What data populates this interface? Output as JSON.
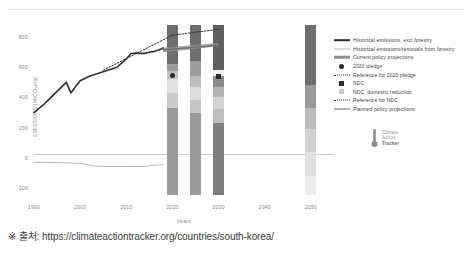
{
  "caption": "※ 출처: https://climateactiontracker.org/countries/south-korea/",
  "logo": {
    "line1": "Climate",
    "line2": "Action",
    "line3": "Tracker",
    "icon": "thermometer-icon"
  },
  "legend": {
    "items": [
      {
        "key": "thick-line",
        "color": "#2f2f2f",
        "label": "Historical emissions, excl forestry"
      },
      {
        "key": "thin-line",
        "color": "#b9b9b9",
        "label": "Historical emissions/removals from forestry"
      },
      {
        "key": "thick-band",
        "color": "#8f8f8f",
        "label": "Current policy projections"
      },
      {
        "key": "dot",
        "color": "#2b2b2b",
        "label": "2020 pledge"
      },
      {
        "key": "dotted-line",
        "color": "#2f2f2f",
        "label": "Reference for 2020 pledge"
      },
      {
        "key": "square",
        "color": "#2b2b2b",
        "label": "NDC"
      },
      {
        "key": "square-light",
        "color": "#c9c9c9",
        "label": "NDC, domestic reduction"
      },
      {
        "key": "dotted-line",
        "color": "#2f2f2f",
        "label": "Reference for NDC"
      },
      {
        "key": "line",
        "color": "#6d6d6d",
        "label": "Planned policy projections"
      }
    ]
  },
  "chart_data": {
    "type": "line",
    "title": "",
    "xlabel": "Years",
    "ylabel": "EMISSIONS [MtCO₂e/a]",
    "xlim": [
      1990,
      2055
    ],
    "ylim": [
      -280,
      900
    ],
    "xticks": [
      1990,
      2000,
      2010,
      2020,
      2030,
      2040,
      2050
    ],
    "xtick_labels": [
      "1990",
      "2000",
      "2010",
      "2020",
      "2030",
      "2040",
      "2050"
    ],
    "yticks": [
      800,
      600,
      400,
      200,
      0,
      -200
    ],
    "ytick_labels": [
      "800",
      "600",
      "400",
      "200",
      "0",
      "-200"
    ],
    "grid": false,
    "legend_position": "right",
    "series": [
      {
        "name": "Historical emissions, excl forestry",
        "type": "line",
        "color": "#2f2f2f",
        "width": 1.6,
        "x": [
          1990,
          1992,
          1994,
          1996,
          1997,
          1998,
          1999,
          2000,
          2002,
          2004,
          2006,
          2008,
          2010,
          2011,
          2012,
          2013,
          2014,
          2015,
          2016,
          2017,
          2018
        ],
        "y": [
          300,
          350,
          410,
          470,
          500,
          430,
          470,
          510,
          540,
          560,
          580,
          600,
          655,
          690,
          695,
          692,
          692,
          700,
          705,
          715,
          728
        ]
      },
      {
        "name": "Historical emissions/removals from forestry",
        "type": "line",
        "color": "#b9b9b9",
        "width": 1.0,
        "x": [
          1990,
          1995,
          2000,
          2003,
          2005,
          2010,
          2014,
          2016,
          2018
        ],
        "y": [
          -30,
          -32,
          -38,
          -55,
          -58,
          -58,
          -57,
          -50,
          -45
        ]
      },
      {
        "name": "Current policy projections",
        "type": "band",
        "color": "#8f8f8f",
        "opacity": 0.85,
        "x": [
          2018,
          2030
        ],
        "y_low": [
          700,
          740
        ],
        "y_high": [
          730,
          760
        ]
      },
      {
        "name": "Reference for 2020 pledge",
        "type": "dotted",
        "color": "#2f2f2f",
        "x": [
          2005,
          2020
        ],
        "y": [
          580,
          813
        ]
      },
      {
        "name": "Reference for NDC",
        "type": "dotted",
        "color": "#2f2f2f",
        "x": [
          2020,
          2030
        ],
        "y": [
          813,
          851
        ]
      },
      {
        "name": "Planned policy projections",
        "type": "line",
        "color": "#6d6d6d",
        "width": 1.2,
        "x": [
          2018,
          2030
        ],
        "y": [
          715,
          745
        ]
      }
    ],
    "markers": [
      {
        "name": "2020 pledge",
        "shape": "circle",
        "x": 2020,
        "y": 543,
        "color": "#2b2b2b"
      },
      {
        "name": "NDC",
        "shape": "square",
        "x": 2030,
        "y": 536,
        "color": "#2b2b2b"
      }
    ],
    "bars": [
      {
        "name": "2020-bar",
        "x": 2020,
        "top": 880,
        "bottom": -250,
        "segments": [
          {
            "from": 620,
            "to": 880,
            "color": "#6e6e6e"
          },
          {
            "from": 575,
            "to": 620,
            "color": "#9c9c9c"
          },
          {
            "from": 520,
            "to": 575,
            "color": "#c2c2c2"
          },
          {
            "from": 430,
            "to": 520,
            "color": "#e2e2e2"
          },
          {
            "from": 330,
            "to": 430,
            "color": "#cbcbcb"
          },
          {
            "from": -250,
            "to": 330,
            "color": "#9a9a9a"
          }
        ]
      },
      {
        "name": "2025-bar",
        "x": 2025,
        "top": 880,
        "bottom": -250,
        "segments": [
          {
            "from": 640,
            "to": 880,
            "color": "#6e6e6e"
          },
          {
            "from": 545,
            "to": 640,
            "color": "#9c9c9c"
          },
          {
            "from": 470,
            "to": 545,
            "color": "#bdbdbd"
          },
          {
            "from": 380,
            "to": 470,
            "color": "#dcdcdc"
          },
          {
            "from": 300,
            "to": 380,
            "color": "#c6c6c6"
          },
          {
            "from": -250,
            "to": 300,
            "color": "#9a9a9a"
          }
        ]
      },
      {
        "name": "2030-bar",
        "x": 2030,
        "top": 880,
        "bottom": -250,
        "segments": [
          {
            "from": 580,
            "to": 880,
            "color": "#5f5f5f"
          },
          {
            "from": 540,
            "to": 580,
            "color": "#efefef"
          },
          {
            "from": 470,
            "to": 540,
            "color": "#8b8b8b"
          },
          {
            "from": 400,
            "to": 470,
            "color": "#b2b2b2"
          },
          {
            "from": 320,
            "to": 400,
            "color": "#d2d2d2"
          },
          {
            "from": 230,
            "to": 320,
            "color": "#bdbdbd"
          },
          {
            "from": -250,
            "to": 230,
            "color": "#7e7e7e"
          }
        ]
      },
      {
        "name": "2050-bar",
        "x": 2050,
        "top": 880,
        "bottom": -250,
        "segments": [
          {
            "from": 480,
            "to": 880,
            "color": "#6e6e6e"
          },
          {
            "from": 330,
            "to": 480,
            "color": "#9a9a9a"
          },
          {
            "from": 190,
            "to": 330,
            "color": "#bcbcbc"
          },
          {
            "from": 40,
            "to": 190,
            "color": "#d3d3d3"
          },
          {
            "from": -120,
            "to": 40,
            "color": "#e0e0e0"
          },
          {
            "from": -250,
            "to": -120,
            "color": "#ededed"
          }
        ]
      }
    ]
  }
}
